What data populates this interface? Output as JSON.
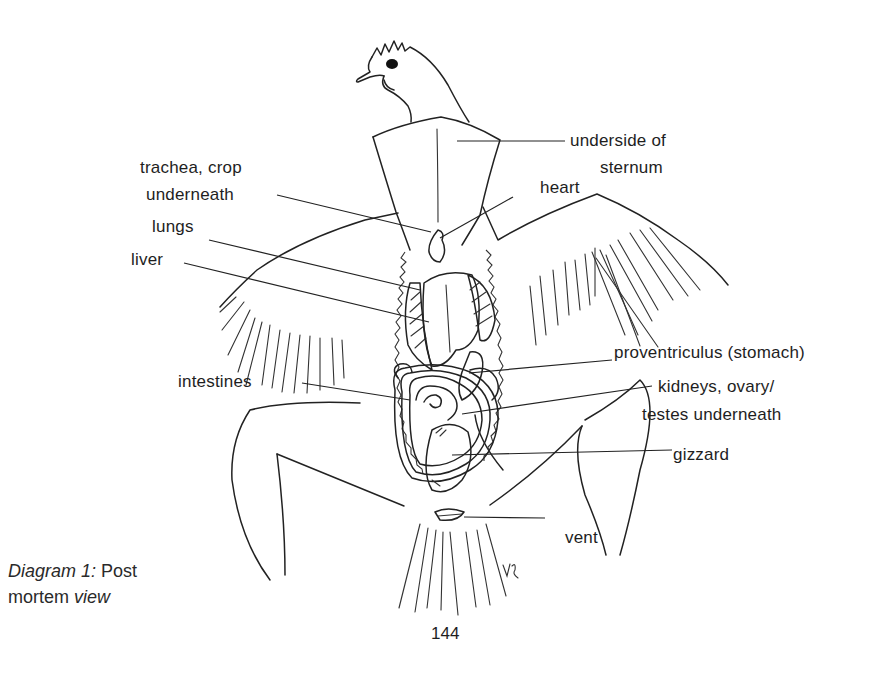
{
  "diagram": {
    "title_italic_1": "Diagram 1:",
    "title_regular_1": "Post",
    "title_regular_2": "mortem",
    "title_italic_2": "view",
    "labels": {
      "underside_sternum_1": "underside of",
      "underside_sternum_2": "sternum",
      "trachea_1": "trachea, crop",
      "trachea_2": "underneath",
      "heart": "heart",
      "lungs": "lungs",
      "liver": "liver",
      "proventriculus": "proventriculus (stomach)",
      "intestines": "intestines",
      "kidneys_1": "kidneys, ovary/",
      "kidneys_2": "testes underneath",
      "gizzard": "gizzard",
      "vent": "vent"
    },
    "artist_initials": "VR",
    "page_number": "144",
    "colors": {
      "ink": "#222222",
      "paper": "#ffffff"
    }
  }
}
